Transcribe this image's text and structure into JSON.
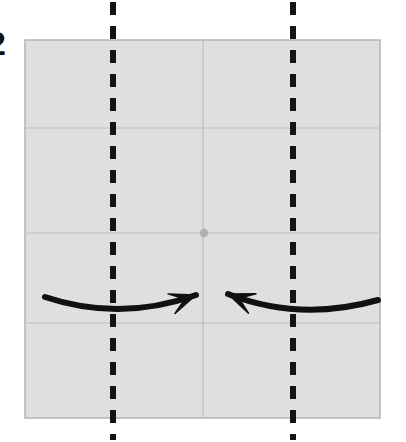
{
  "figure": {
    "panel_label": "2",
    "panel_label_x": -13,
    "panel_label_y": 26,
    "width": 406,
    "height": 442,
    "background_color": "#ffffff"
  },
  "plate": {
    "name": "square-plate",
    "x": 25,
    "y": 40,
    "width": 355,
    "height": 378,
    "fill_color": "#e0e0e0",
    "border_color": "#b4b4b4",
    "border_width": 1.5
  },
  "grid": {
    "line_color": "#bdbdbd",
    "line_width": 1.2,
    "vertical_lines_x": [
      203
    ],
    "horizontal_lines_y": [
      128,
      233,
      323
    ]
  },
  "center_marker": {
    "name": "center-point",
    "cx": 204,
    "cy": 233,
    "r": 4.2,
    "fill_color": "#b0b0b0"
  },
  "dashed_lines": [
    {
      "name": "dashed-line-left",
      "x": 113,
      "y_top": 2,
      "y_bottom": 440,
      "color": "#141414",
      "width": 6,
      "dash": "13 11"
    },
    {
      "name": "dashed-line-right",
      "x": 293,
      "y_top": 2,
      "y_bottom": 440,
      "color": "#141414",
      "width": 6,
      "dash": "13 11"
    }
  ],
  "arrows": [
    {
      "name": "arrow-left-curved",
      "direction": "rightward",
      "tail_x": 45,
      "tail_y": 297,
      "ctrl_x": 120,
      "ctrl_y": 322,
      "head_x": 196,
      "head_y": 295,
      "color": "#111111",
      "stroke_width": 6
    },
    {
      "name": "arrow-right-curved",
      "direction": "leftward",
      "tail_x": 378,
      "tail_y": 300,
      "ctrl_x": 300,
      "ctrl_y": 322,
      "head_x": 228,
      "head_y": 294,
      "color": "#111111",
      "stroke_width": 6
    }
  ]
}
